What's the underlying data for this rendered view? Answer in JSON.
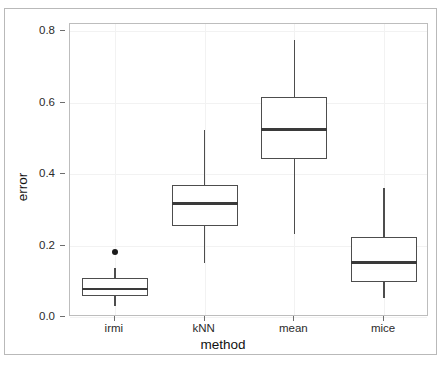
{
  "chart_data": {
    "type": "box",
    "title": "",
    "xlabel": "method",
    "ylabel": "error",
    "categories": [
      "irmi",
      "kNN",
      "mean",
      "mice"
    ],
    "ylim": [
      0.0,
      0.82
    ],
    "yticks": [
      0.0,
      0.2,
      0.4,
      0.6,
      0.8
    ],
    "ytick_labels": [
      "0.0",
      "0.2",
      "0.4",
      "0.6",
      "0.8"
    ],
    "grid": true,
    "legend": "none",
    "boxes": [
      {
        "category": "irmi",
        "whisker_low": 0.032,
        "q1": 0.058,
        "median": 0.078,
        "q3": 0.108,
        "whisker_high": 0.138,
        "outliers": [
          0.183
        ]
      },
      {
        "category": "kNN",
        "whisker_low": 0.152,
        "q1": 0.256,
        "median": 0.318,
        "q3": 0.37,
        "whisker_high": 0.524,
        "outliers": []
      },
      {
        "category": "mean",
        "whisker_low": 0.233,
        "q1": 0.442,
        "median": 0.525,
        "q3": 0.615,
        "whisker_high": 0.775,
        "outliers": []
      },
      {
        "category": "mice",
        "whisker_low": 0.052,
        "q1": 0.098,
        "median": 0.152,
        "q3": 0.225,
        "whisker_high": 0.362,
        "outliers": []
      }
    ]
  },
  "colors": {
    "box_stroke": "#4d4d4d",
    "median_stroke": "#3a3a3a",
    "grid": "#f2f2f2",
    "panel_border": "#bdbdbd",
    "outer_border": "#b9b9b9",
    "text": "#2b2b2b",
    "background": "#ffffff"
  }
}
